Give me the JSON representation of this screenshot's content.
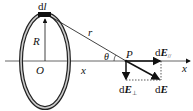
{
  "diagram": {
    "labels": {
      "element": "dl",
      "element_d": "d",
      "element_l": "l",
      "radius": "R",
      "distance": "r",
      "origin": "O",
      "x_distance": "x",
      "angle": "θ",
      "point": "P",
      "field_parallel_d": "d",
      "field_parallel_E": "E",
      "field_parallel_sub": "//",
      "field_perp_d": "d",
      "field_perp_E": "E",
      "field_perp_sub": "⊥",
      "field_total_d": "d",
      "field_total_E": "E",
      "axis": "x"
    },
    "colors": {
      "stroke": "#111111",
      "ring_fill": "#ffffff",
      "background": "#ffffff"
    }
  }
}
